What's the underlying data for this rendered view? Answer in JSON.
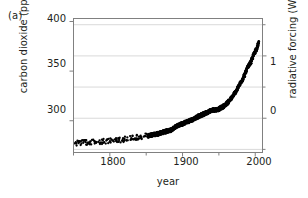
{
  "figure": {
    "panel_label": "(a)",
    "background": "#ffffff",
    "ink_color": "#231f20",
    "grid_color": "#d9d9d9",
    "axis_color": "#808080",
    "data_color": "#000000"
  },
  "chart_data": {
    "type": "scatter",
    "title": "",
    "subtitle": "",
    "xlabel": "year",
    "ylabel": "carbon dioxide (ppm)",
    "y2label": "radiative forcing (W m-2)",
    "y2label_html": "radiative forcing (W m<sup>-2</sup>)",
    "xlim": [
      1750,
      2010
    ],
    "ylim": [
      268,
      403
    ],
    "y2lim": [
      -0.55,
      1.6
    ],
    "grid": true,
    "grid_axis": "y",
    "legend": false,
    "xticks": [
      1800,
      1900,
      2000
    ],
    "xticklabels": [
      "1800",
      "1900",
      "2000"
    ],
    "xminorticks": [
      1750,
      1850,
      1950
    ],
    "yticks": [
      300,
      350,
      400
    ],
    "yticklabels": [
      "300",
      "350",
      "400"
    ],
    "y2ticks": [
      0,
      1
    ],
    "y2ticklabels": [
      "0",
      "1"
    ],
    "y2_all_gridlines": [
      -0.5,
      0,
      0.5,
      1.0,
      1.5
    ],
    "annotations": [],
    "series": [
      {
        "name": "atmospheric CO2 concentration",
        "marker": "dot",
        "x": [
          1750,
          1754,
          1758,
          1762,
          1766,
          1770,
          1774,
          1778,
          1782,
          1786,
          1790,
          1794,
          1798,
          1802,
          1806,
          1810,
          1814,
          1818,
          1822,
          1826,
          1830,
          1834,
          1838,
          1842,
          1846,
          1850,
          1854,
          1858,
          1862,
          1866,
          1870,
          1874,
          1878,
          1882,
          1886,
          1890,
          1894,
          1898,
          1902,
          1906,
          1910,
          1914,
          1918,
          1922,
          1926,
          1930,
          1934,
          1938,
          1942,
          1946,
          1950,
          1954,
          1958,
          1962,
          1966,
          1970,
          1974,
          1978,
          1982,
          1986,
          1990,
          1994,
          1998,
          2002,
          2005
        ],
        "y": [
          277.0,
          277.4,
          277.2,
          277.8,
          278.0,
          277.6,
          278.2,
          278.4,
          278.1,
          278.6,
          279.0,
          279.3,
          279.1,
          279.8,
          280.2,
          280.0,
          280.6,
          281.0,
          281.4,
          281.8,
          282.3,
          282.8,
          283.4,
          284.0,
          284.6,
          285.2,
          285.0,
          285.6,
          286.2,
          287.0,
          287.8,
          288.6,
          289.4,
          290.2,
          291.2,
          294.0,
          295.5,
          296.5,
          297.5,
          299.0,
          300.0,
          301.2,
          303.0,
          304.5,
          305.8,
          307.0,
          308.5,
          310.0,
          310.8,
          311.2,
          311.8,
          313.5,
          315.3,
          318.4,
          321.4,
          325.7,
          330.2,
          335.4,
          341.0,
          347.2,
          354.4,
          358.8,
          366.6,
          373.1,
          378.8
        ],
        "band_halfwidth_ppm": 2.2,
        "note": "thick dark band of overlapping measurement points: Antarctic ice-core records prior to ~1958 and direct atmospheric observations thereafter"
      }
    ]
  }
}
